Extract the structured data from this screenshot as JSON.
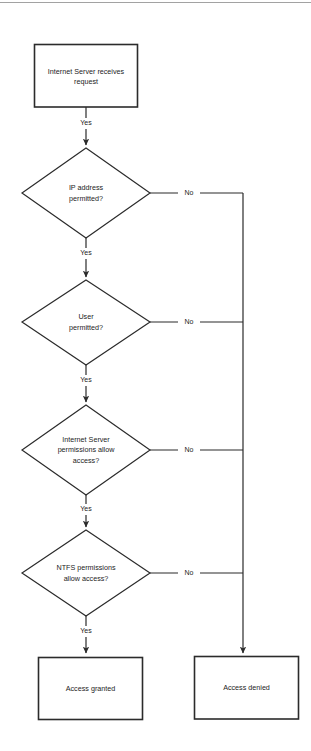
{
  "diagram": {
    "type": "flowchart",
    "background_color": "#ffffff",
    "line_color": "#2b2b2b",
    "text_color": "#1c1c1c"
  },
  "nodes": {
    "start": {
      "shape": "process",
      "line1": "Internet Server receives",
      "line2": "request"
    },
    "decision_ip": {
      "shape": "decision",
      "line1": "IP address",
      "line2": "permitted?"
    },
    "decision_user": {
      "shape": "decision",
      "line1": "User",
      "line2": "permitted?"
    },
    "decision_server_perms": {
      "shape": "decision",
      "line1": "Internet Server",
      "line2": "permissions allow",
      "line3": "access?"
    },
    "decision_ntfs": {
      "shape": "decision",
      "line1": "NTFS permissions",
      "line2": "allow access?"
    },
    "granted": {
      "shape": "process",
      "line1": "Access granted"
    },
    "denied": {
      "shape": "process",
      "line1": "Access denied"
    }
  },
  "edges": {
    "start_to_ip": "Yes",
    "ip_no": "No",
    "ip_to_user": "Yes",
    "user_no": "No",
    "user_to_server": "Yes",
    "server_no": "No",
    "server_to_ntfs": "Yes",
    "ntfs_no": "No",
    "ntfs_to_granted": "Yes"
  }
}
